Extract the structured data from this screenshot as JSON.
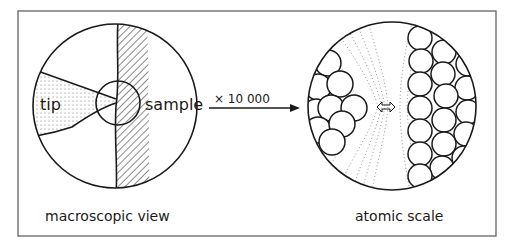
{
  "figure": {
    "left_panel": {
      "tip_label": "tip",
      "sample_label": "sample",
      "caption": "macroscopic view"
    },
    "magnification": {
      "label": "× 10 000"
    },
    "right_panel": {
      "caption": "atomic scale",
      "gap_icon": "double-arrow-icon"
    }
  },
  "colors": {
    "stroke": "#1a1a1a",
    "frame": "#555555",
    "background": "#ffffff"
  }
}
